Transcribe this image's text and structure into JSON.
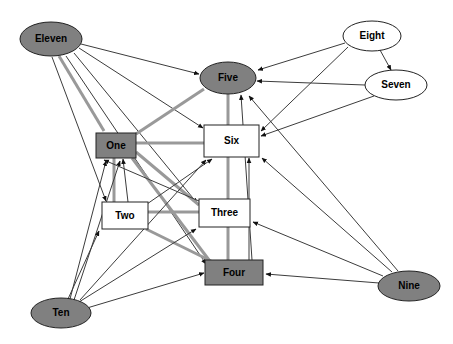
{
  "diagram": {
    "type": "directed-graph",
    "title": "",
    "background_color": "#ffffff",
    "edge_color_thin": "#3c3c3c",
    "edge_color_thick": "#999999",
    "node_fill_dark": "#808080",
    "node_fill_light": "#ffffff",
    "node_stroke": "#222222",
    "label_color": "#000000",
    "nodes": [
      {
        "id": "eleven",
        "label": "Eleven",
        "shape": "ellipse",
        "fill": "#808080",
        "cx": 51,
        "cy": 39,
        "rx": 31,
        "ry": 17,
        "font_size": 10
      },
      {
        "id": "eight",
        "label": "Eight",
        "shape": "ellipse",
        "fill": "#ffffff",
        "cx": 372,
        "cy": 36,
        "rx": 29,
        "ry": 15,
        "font_size": 10
      },
      {
        "id": "five",
        "label": "Five",
        "shape": "ellipse",
        "fill": "#808080",
        "cx": 228,
        "cy": 78,
        "rx": 28,
        "ry": 16,
        "font_size": 10
      },
      {
        "id": "seven",
        "label": "Seven",
        "shape": "ellipse",
        "fill": "#ffffff",
        "cx": 396,
        "cy": 85,
        "rx": 31,
        "ry": 15,
        "font_size": 10
      },
      {
        "id": "one",
        "label": "One",
        "shape": "rect",
        "fill": "#808080",
        "x": 96,
        "y": 133,
        "w": 40,
        "h": 25,
        "font_size": 10
      },
      {
        "id": "six",
        "label": "Six",
        "shape": "rect",
        "fill": "#ffffff",
        "x": 204,
        "y": 125,
        "w": 55,
        "h": 32,
        "font_size": 10
      },
      {
        "id": "two",
        "label": "Two",
        "shape": "rect",
        "fill": "#ffffff",
        "x": 102,
        "y": 202,
        "w": 46,
        "h": 27,
        "font_size": 10
      },
      {
        "id": "three",
        "label": "Three",
        "shape": "rect",
        "fill": "#ffffff",
        "x": 199,
        "y": 199,
        "w": 51,
        "h": 28,
        "font_size": 10
      },
      {
        "id": "four",
        "label": "Four",
        "shape": "rect",
        "fill": "#808080",
        "x": 205,
        "y": 260,
        "w": 58,
        "h": 25,
        "font_size": 10
      },
      {
        "id": "ten",
        "label": "Ten",
        "shape": "ellipse",
        "fill": "#808080",
        "cx": 61,
        "cy": 313,
        "rx": 30,
        "ry": 15,
        "font_size": 10
      },
      {
        "id": "nine",
        "label": "Nine",
        "shape": "ellipse",
        "fill": "#808080",
        "cx": 409,
        "cy": 286,
        "rx": 31,
        "ry": 15,
        "font_size": 10
      }
    ],
    "edges": [
      {
        "from": "eleven",
        "to": "five",
        "style": "thin",
        "x1": 81,
        "y1": 44,
        "x2": 199,
        "y2": 74,
        "arrow": true
      },
      {
        "from": "eleven",
        "to": "six",
        "style": "thin",
        "x1": 79,
        "y1": 48,
        "x2": 203,
        "y2": 128,
        "arrow": true
      },
      {
        "from": "eleven",
        "to": "three",
        "style": "thin",
        "x1": 74,
        "y1": 53,
        "x2": 197,
        "y2": 203,
        "arrow": true
      },
      {
        "from": "eleven",
        "to": "four",
        "style": "thin",
        "x1": 66,
        "y1": 56,
        "x2": 206,
        "y2": 264,
        "arrow": true
      },
      {
        "from": "eleven",
        "to": "two",
        "style": "thin",
        "x1": 52,
        "y1": 57,
        "x2": 106,
        "y2": 201,
        "arrow": true
      },
      {
        "from": "eleven",
        "to": "one",
        "style": "thick",
        "x1": 59,
        "y1": 56,
        "x2": 104,
        "y2": 131,
        "arrow": false
      },
      {
        "from": "eight",
        "to": "five",
        "style": "thin",
        "x1": 345,
        "y1": 43,
        "x2": 258,
        "y2": 70,
        "arrow": true
      },
      {
        "from": "eight",
        "to": "seven",
        "style": "thin",
        "x1": 380,
        "y1": 50,
        "x2": 391,
        "y2": 70,
        "arrow": true
      },
      {
        "from": "eight",
        "to": "six",
        "style": "thin",
        "x1": 348,
        "y1": 47,
        "x2": 261,
        "y2": 131,
        "arrow": true
      },
      {
        "from": "seven",
        "to": "five",
        "style": "thin",
        "x1": 365,
        "y1": 85,
        "x2": 257,
        "y2": 81,
        "arrow": true
      },
      {
        "from": "seven",
        "to": "six",
        "style": "thin",
        "x1": 374,
        "y1": 96,
        "x2": 261,
        "y2": 136,
        "arrow": true
      },
      {
        "from": "five",
        "to": "six",
        "style": "thick",
        "x1": 228,
        "y1": 94,
        "x2": 228,
        "y2": 125,
        "arrow": false
      },
      {
        "from": "five",
        "to": "one",
        "style": "thick",
        "x1": 204,
        "y1": 89,
        "x2": 136,
        "y2": 134,
        "arrow": false
      },
      {
        "from": "one",
        "to": "six",
        "style": "thick",
        "x1": 136,
        "y1": 143,
        "x2": 204,
        "y2": 143,
        "arrow": false
      },
      {
        "from": "one",
        "to": "two",
        "style": "thick",
        "x1": 114,
        "y1": 158,
        "x2": 114,
        "y2": 202,
        "arrow": false
      },
      {
        "from": "one",
        "to": "three",
        "style": "thick",
        "x1": 136,
        "y1": 152,
        "x2": 199,
        "y2": 205,
        "arrow": false
      },
      {
        "from": "one",
        "to": "four",
        "style": "thick",
        "x1": 132,
        "y1": 158,
        "x2": 209,
        "y2": 260,
        "arrow": false
      },
      {
        "from": "two",
        "to": "three",
        "style": "thick",
        "x1": 148,
        "y1": 212,
        "x2": 199,
        "y2": 212,
        "arrow": false
      },
      {
        "from": "two",
        "to": "four",
        "style": "thick",
        "x1": 146,
        "y1": 229,
        "x2": 211,
        "y2": 261,
        "arrow": false
      },
      {
        "from": "six",
        "to": "three",
        "style": "thick",
        "x1": 228,
        "y1": 157,
        "x2": 228,
        "y2": 199,
        "arrow": false
      },
      {
        "from": "three",
        "to": "four",
        "style": "thick",
        "x1": 228,
        "y1": 227,
        "x2": 228,
        "y2": 260,
        "arrow": false
      },
      {
        "from": "four",
        "to": "six",
        "style": "thin",
        "x1": 249,
        "y1": 260,
        "x2": 249,
        "y2": 158,
        "arrow": true
      },
      {
        "from": "four",
        "to": "five",
        "style": "thin",
        "x1": 252,
        "y1": 260,
        "x2": 241,
        "y2": 95,
        "arrow": true
      },
      {
        "from": "two",
        "to": "one",
        "style": "thin",
        "x1": 128,
        "y1": 202,
        "x2": 123,
        "y2": 159,
        "arrow": true
      },
      {
        "from": "two",
        "to": "six",
        "style": "thin",
        "x1": 147,
        "y1": 204,
        "x2": 212,
        "y2": 159,
        "arrow": true
      },
      {
        "from": "three",
        "to": "one",
        "style": "thin",
        "x1": 199,
        "y1": 201,
        "x2": 104,
        "y2": 160,
        "arrow": true
      },
      {
        "from": "ten",
        "to": "one",
        "style": "thin",
        "x1": 70,
        "y1": 299,
        "x2": 106,
        "y2": 161,
        "arrow": true
      },
      {
        "from": "ten",
        "to": "one",
        "style": "thin",
        "x1": 74,
        "y1": 300,
        "x2": 120,
        "y2": 161,
        "arrow": true
      },
      {
        "from": "ten",
        "to": "two",
        "style": "thin",
        "x1": 68,
        "y1": 299,
        "x2": 99,
        "y2": 231,
        "arrow": true
      },
      {
        "from": "ten",
        "to": "three",
        "style": "thin",
        "x1": 79,
        "y1": 302,
        "x2": 196,
        "y2": 229,
        "arrow": true
      },
      {
        "from": "ten",
        "to": "four",
        "style": "thin",
        "x1": 87,
        "y1": 308,
        "x2": 204,
        "y2": 273,
        "arrow": true
      },
      {
        "from": "ten",
        "to": "six",
        "style": "thin",
        "x1": 80,
        "y1": 300,
        "x2": 206,
        "y2": 160,
        "arrow": true
      },
      {
        "from": "nine",
        "to": "four",
        "style": "thin",
        "x1": 379,
        "y1": 283,
        "x2": 266,
        "y2": 274,
        "arrow": true
      },
      {
        "from": "nine",
        "to": "three",
        "style": "thin",
        "x1": 383,
        "y1": 276,
        "x2": 253,
        "y2": 222,
        "arrow": true
      },
      {
        "from": "nine",
        "to": "six",
        "style": "thin",
        "x1": 392,
        "y1": 272,
        "x2": 262,
        "y2": 158,
        "arrow": true
      },
      {
        "from": "nine",
        "to": "five",
        "style": "thin",
        "x1": 398,
        "y1": 271,
        "x2": 249,
        "y2": 96,
        "arrow": true
      }
    ]
  }
}
